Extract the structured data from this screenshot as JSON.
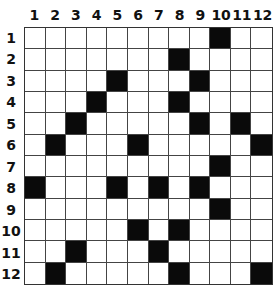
{
  "puzzle": {
    "rows": 12,
    "cols": 12,
    "column_labels": [
      "1",
      "2",
      "3",
      "4",
      "5",
      "6",
      "7",
      "8",
      "9",
      "10",
      "11",
      "12"
    ],
    "row_labels": [
      "1",
      "2",
      "3",
      "4",
      "5",
      "6",
      "7",
      "8",
      "9",
      "10",
      "11",
      "12"
    ],
    "black_cells": [
      [
        1,
        10
      ],
      [
        2,
        8
      ],
      [
        3,
        5
      ],
      [
        3,
        9
      ],
      [
        4,
        4
      ],
      [
        4,
        8
      ],
      [
        5,
        3
      ],
      [
        5,
        9
      ],
      [
        5,
        11
      ],
      [
        6,
        2
      ],
      [
        6,
        6
      ],
      [
        6,
        12
      ],
      [
        7,
        10
      ],
      [
        8,
        1
      ],
      [
        8,
        5
      ],
      [
        8,
        7
      ],
      [
        8,
        9
      ],
      [
        9,
        10
      ],
      [
        10,
        6
      ],
      [
        10,
        8
      ],
      [
        11,
        3
      ],
      [
        11,
        7
      ],
      [
        12,
        2
      ],
      [
        12,
        8
      ],
      [
        12,
        12
      ]
    ],
    "colors": {
      "black": "#0a0a0a",
      "white": "#ffffff",
      "line": "#444444"
    }
  }
}
